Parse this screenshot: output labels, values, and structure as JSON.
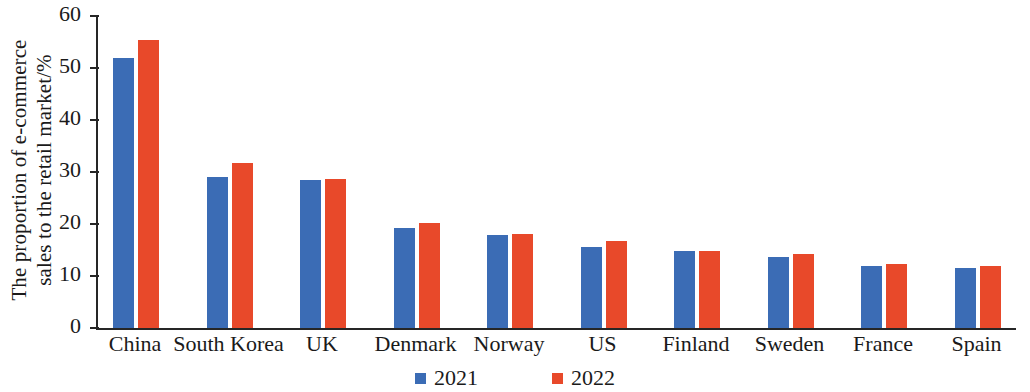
{
  "chart_data": {
    "type": "bar",
    "title": "",
    "subtitle": "",
    "xlabel": "",
    "ylabel": "The proportion of e-commerce sales to the retail market/%",
    "ylabel_lines": [
      "The proportion of e-commerce",
      "sales to the retail market/%"
    ],
    "categories": [
      "China",
      "South Korea",
      "UK",
      "Denmark",
      "Norway",
      "US",
      "Finland",
      "Sweden",
      "France",
      "Spain"
    ],
    "series": [
      {
        "name": "2021",
        "color": "#3b6cb5",
        "values": [
          52.0,
          29.0,
          28.4,
          19.3,
          17.9,
          15.6,
          14.8,
          13.7,
          11.9,
          11.5
        ]
      },
      {
        "name": "2022",
        "color": "#e8492a",
        "values": [
          55.4,
          31.8,
          28.7,
          20.2,
          18.1,
          16.7,
          14.9,
          14.3,
          12.3,
          11.9
        ]
      }
    ],
    "ylim": [
      0,
      60
    ],
    "yticks": [
      0,
      10,
      20,
      30,
      40,
      50,
      60
    ],
    "ytick_labels": [
      "0",
      "10",
      "20",
      "30",
      "40",
      "50",
      "60"
    ],
    "grid": false,
    "legend_position": "bottom",
    "legend": [
      "2021",
      "2022"
    ]
  }
}
